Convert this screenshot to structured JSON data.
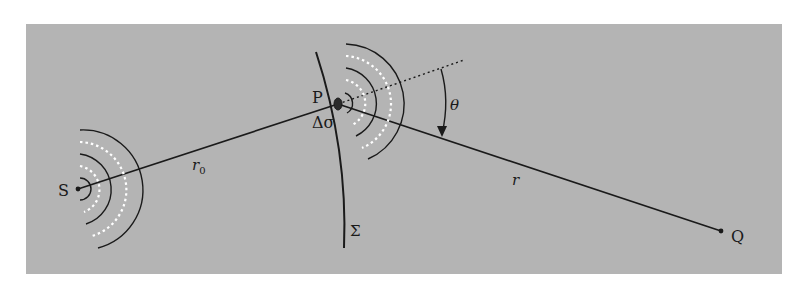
{
  "diagram": {
    "type": "wave-propagation-geometry",
    "colors": {
      "background": "#ffffff",
      "panel": "#b4b4b4",
      "lines": "#1a1a1a",
      "wavefront_dashed": "#ffffff"
    },
    "nodes": [
      {
        "id": "S",
        "label": "S",
        "role": "source point"
      },
      {
        "id": "P",
        "label": "P",
        "role": "point on surface"
      },
      {
        "id": "Q",
        "label": "Q",
        "role": "observation point"
      }
    ],
    "labels": {
      "source": "S",
      "point_p": "P",
      "point_q": "Q",
      "area_element": "Δσ",
      "surface": "Σ",
      "distance_sp": "r",
      "distance_sp_sub": "0",
      "distance_pq": "r",
      "angle": "θ"
    },
    "edges": [
      {
        "from": "S",
        "to": "P",
        "label": "r0",
        "style": "solid"
      },
      {
        "from": "P",
        "to": "Q",
        "label": "r",
        "style": "solid"
      },
      {
        "from": "P",
        "to": "normal-direction",
        "label": "",
        "style": "dotted"
      }
    ],
    "annotations": [
      {
        "type": "angle-arc",
        "label": "θ",
        "between": [
          "normal",
          "PQ"
        ],
        "arrow": "toward PQ"
      },
      {
        "type": "wavefronts",
        "at": "S",
        "count": 5,
        "style": "alternating solid dark / dashed white"
      },
      {
        "type": "wavefronts",
        "at": "P",
        "count": 5,
        "style": "alternating solid dark / dashed white"
      }
    ]
  }
}
